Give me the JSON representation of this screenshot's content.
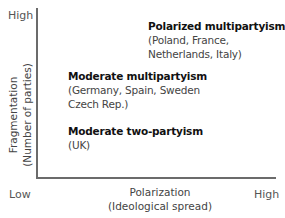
{
  "diagram": {
    "type": "2x2 conceptual plot",
    "y_axis": {
      "title_line1": "Fragmentation",
      "title_line2": "(Number of parties)",
      "high_label": "High",
      "low_label": "Low"
    },
    "x_axis": {
      "title_line1": "Polarization",
      "title_line2": "(Ideological spread)",
      "high_label": "High"
    },
    "regions": [
      {
        "heading": "Polarized multipartyism",
        "examples": [
          "(Poland, France,",
          "Netherlands, Italy)"
        ]
      },
      {
        "heading": "Moderate multipartyism",
        "examples": [
          "(Germany, Spain, Sweden",
          "Czech Rep.)"
        ]
      },
      {
        "heading": "Moderate two-partyism",
        "examples": [
          "(UK)"
        ]
      }
    ]
  },
  "colors": {
    "axis": "#6b6b6b",
    "heading_text": "#111111",
    "body_text": "#444444",
    "background": "#ffffff"
  }
}
